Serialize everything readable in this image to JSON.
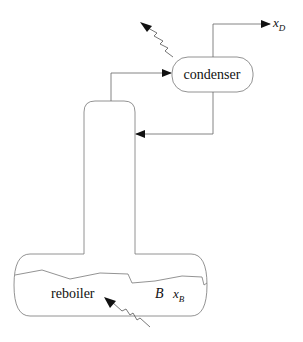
{
  "diagram": {
    "type": "distillation-column-schematic",
    "units": {
      "condenser": {
        "label": "condenser"
      },
      "reboiler": {
        "label": "reboiler"
      }
    },
    "streams": {
      "distillate": {
        "symbol": "x",
        "subscript": "D"
      },
      "bottoms_holdup": {
        "symbol": "B"
      },
      "bottoms_composition": {
        "symbol": "x",
        "subscript": "B"
      }
    },
    "colors": {
      "line": "#555555",
      "arrow": "#111111",
      "text": "#111111"
    }
  }
}
